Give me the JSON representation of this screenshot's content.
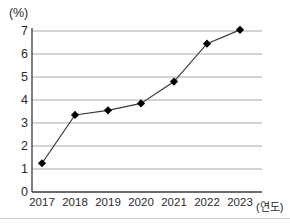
{
  "chart_data": {
    "type": "line",
    "title": "",
    "xlabel": "(연도)",
    "ylabel": "(%)",
    "categories": [
      "2017",
      "2018",
      "2019",
      "2020",
      "2021",
      "2022",
      "2023"
    ],
    "values": [
      1.25,
      3.35,
      3.55,
      3.85,
      4.8,
      6.45,
      7.05
    ],
    "series": [
      {
        "name": "",
        "values": [
          1.25,
          3.35,
          3.55,
          3.85,
          4.8,
          6.45,
          7.05
        ]
      }
    ],
    "ylim": [
      0,
      7
    ],
    "yticks": [
      "0",
      "1",
      "2",
      "3",
      "4",
      "5",
      "6",
      "7"
    ],
    "ytick_values": [
      0,
      1,
      2,
      3,
      4,
      5,
      6,
      7
    ],
    "grid": true,
    "grid_axis": "y",
    "legend": "none",
    "marker": "diamond",
    "marker_color": "#000000",
    "line_color": "#3a3a3a",
    "grid_color": "#a8a8a8",
    "axis_color": "#3a3a3a",
    "background_color": "#ffffff"
  },
  "axes": {
    "y_unit_label": "(%)",
    "x_axis_title": "(연도)"
  }
}
